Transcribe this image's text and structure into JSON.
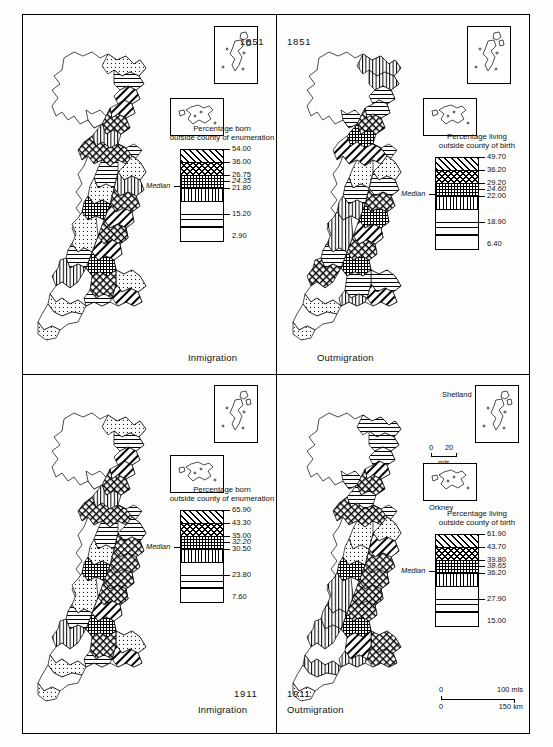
{
  "figure": {
    "panels": [
      {
        "id": "top-left",
        "year": "1851",
        "caption": "Inmigration",
        "legend": {
          "title_line1": "Percentage born",
          "title_line2": "outside county of enumeration",
          "median_label": "Median",
          "values": [
            "54.00",
            "36.00",
            "26.75",
            "24.35",
            "21.80",
            "15.20",
            "2.90"
          ],
          "median_value": "24.35",
          "classes": [
            "diagonal-hatch",
            "checker-hatch",
            "grid-hatch",
            "vertical-hatch",
            "blank",
            "horizontal-hatch",
            "dotted"
          ]
        }
      },
      {
        "id": "top-right",
        "year": "1851",
        "caption": "Outmigration",
        "legend": {
          "title_line1": "Percentage living",
          "title_line2": "outside county of birth",
          "median_label": "Median",
          "values": [
            "49.70",
            "36.20",
            "29.20",
            "24.60",
            "22.00",
            "18.90",
            "6.40"
          ],
          "median_value": "24.60",
          "classes": [
            "diagonal-hatch",
            "checker-hatch",
            "grid-hatch",
            "vertical-hatch",
            "blank",
            "horizontal-hatch",
            "dotted"
          ]
        }
      },
      {
        "id": "bottom-left",
        "year": "1911",
        "caption": "Inmigration",
        "legend": {
          "title_line1": "Percentage born",
          "title_line2": "outside county of enumeration",
          "median_label": "Median",
          "values": [
            "65.90",
            "43.30",
            "35.00",
            "32.20",
            "30.50",
            "23.80",
            "7.60"
          ],
          "median_value": "32.20",
          "classes": [
            "diagonal-hatch",
            "checker-hatch",
            "grid-hatch",
            "vertical-hatch",
            "blank",
            "horizontal-hatch",
            "dotted"
          ]
        }
      },
      {
        "id": "bottom-right",
        "year": "1911",
        "caption": "Outmigration",
        "legend": {
          "title_line1": "Percentage living",
          "title_line2": "outside county of birth",
          "median_label": "Median",
          "values": [
            "61.90",
            "43.70",
            "39.80",
            "38.65",
            "36.20",
            "27.90",
            "15.00"
          ],
          "median_value": "38.65",
          "classes": [
            "diagonal-hatch",
            "checker-hatch",
            "grid-hatch",
            "vertical-hatch",
            "blank",
            "horizontal-hatch",
            "dotted"
          ]
        }
      }
    ],
    "insets": {
      "shetland_label": "Shetland",
      "orkney_label": "Orkney"
    },
    "inset_scale": {
      "zero": "0",
      "twenty": "20",
      "unit": "mls"
    },
    "main_scale": {
      "miles_zero": "0",
      "miles_max": "100 mls",
      "km_zero": "0",
      "km_max": "150 km"
    }
  }
}
